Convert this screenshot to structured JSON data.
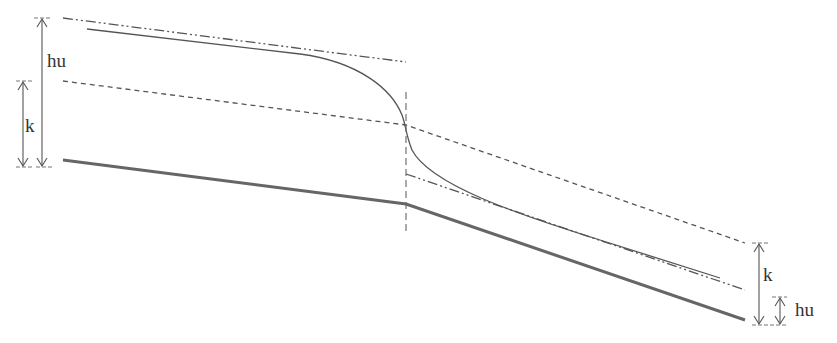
{
  "diagram": {
    "labels": {
      "left_hu": "hu",
      "left_k": "k",
      "right_k": "k",
      "right_hu": "hu"
    },
    "colors": {
      "line": "#555555",
      "thick": "#666666",
      "text": "#333333"
    }
  }
}
